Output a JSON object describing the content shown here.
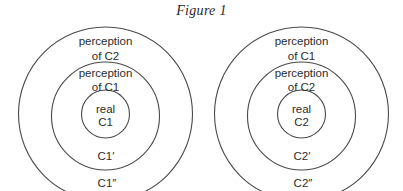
{
  "figure": {
    "title": "Figure 1"
  },
  "diagrams": [
    {
      "name": "left",
      "outer_label_line1": "perception",
      "outer_label_line2": "of C2",
      "middle_label_line1": "perception",
      "middle_label_line2": "of C1",
      "inner_label_line1": "real",
      "inner_label_line2": "C1",
      "middle_ring_label": "C1′",
      "outer_ring_label": "C1″"
    },
    {
      "name": "right",
      "outer_label_line1": "perception",
      "outer_label_line2": "of C1",
      "middle_label_line1": "perception",
      "middle_label_line2": "of C2",
      "inner_label_line1": "real",
      "inner_label_line2": "C2",
      "middle_ring_label": "C2′",
      "outer_ring_label": "C2″"
    }
  ],
  "colors": {
    "stroke": "#4a4a4a",
    "text": "#2b2b2b",
    "background": "#ffffff"
  }
}
